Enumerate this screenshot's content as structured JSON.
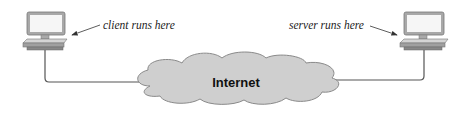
{
  "diagram": {
    "client": {
      "label": "client runs here",
      "icon": "desktop-computer-icon"
    },
    "server": {
      "label": "server runs here",
      "icon": "desktop-computer-icon"
    },
    "network": {
      "label": "Internet",
      "icon": "cloud-icon"
    },
    "colors": {
      "monitor_frame": "#9a9a9a",
      "screen": "#f4f4f4",
      "base": "#b5b5b5",
      "cloud_fill": "#cfcfcf",
      "cloud_stroke": "#8a8a8a",
      "cable": "#555555"
    }
  }
}
